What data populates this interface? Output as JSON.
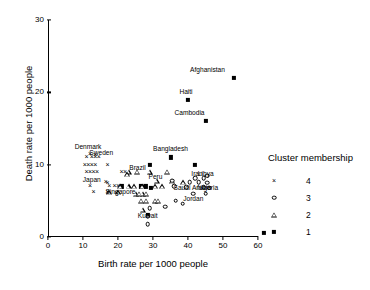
{
  "chart_data": {
    "type": "scatter",
    "title": "",
    "xlabel": "Birth rate per 1000 people",
    "ylabel": "Death rate per 1000 people",
    "xlim": [
      0,
      60
    ],
    "ylim": [
      0,
      30
    ],
    "xticks": [
      0,
      10,
      20,
      30,
      40,
      50,
      60
    ],
    "yticks": [
      0,
      10,
      20,
      30
    ],
    "grid": false,
    "legend": {
      "title": "Cluster membership",
      "position": "right",
      "entries": [
        {
          "label": "4",
          "marker": "x-marker",
          "cluster": 4
        },
        {
          "label": "3",
          "marker": "open-circle-marker",
          "cluster": 3
        },
        {
          "label": "2",
          "marker": "open-triangle-marker",
          "cluster": 2
        },
        {
          "label": "1",
          "marker": "filled-square-marker",
          "cluster": 1
        }
      ]
    },
    "series": [
      {
        "name": "Cluster 1",
        "marker": "filled-square-marker",
        "points": [
          {
            "x": 53,
            "y": 22,
            "label": "Afghanistan"
          },
          {
            "x": 40,
            "y": 19,
            "label": "Haiti"
          },
          {
            "x": 45,
            "y": 16,
            "label": "Cambodia"
          },
          {
            "x": 35,
            "y": 11,
            "label": "Bangladesh"
          },
          {
            "x": 29,
            "y": 10,
            "label": ""
          },
          {
            "x": 42,
            "y": 10,
            "label": ""
          },
          {
            "x": 21,
            "y": 7,
            "label": ""
          },
          {
            "x": 26.5,
            "y": 7,
            "label": ""
          },
          {
            "x": 28,
            "y": 7,
            "label": ""
          },
          {
            "x": 29.5,
            "y": 6.8,
            "label": ""
          },
          {
            "x": 28.5,
            "y": 3,
            "label": "Kuwait"
          }
        ]
      },
      {
        "name": "Cluster 2",
        "marker": "open-triangle-marker",
        "points": [
          {
            "x": 23,
            "y": 9,
            "label": ""
          },
          {
            "x": 25.5,
            "y": 9,
            "label": ""
          },
          {
            "x": 29,
            "y": 9,
            "label": ""
          },
          {
            "x": 34,
            "y": 9,
            "label": ""
          },
          {
            "x": 22.5,
            "y": 8.7,
            "label": ""
          },
          {
            "x": 31,
            "y": 7.8,
            "label": "Peru"
          },
          {
            "x": 35.5,
            "y": 7.7,
            "label": ""
          },
          {
            "x": 38.5,
            "y": 7.6,
            "label": ""
          },
          {
            "x": 20.5,
            "y": 7,
            "label": ""
          },
          {
            "x": 23,
            "y": 7,
            "label": ""
          },
          {
            "x": 24.5,
            "y": 7,
            "label": ""
          },
          {
            "x": 27,
            "y": 7,
            "label": ""
          },
          {
            "x": 30.5,
            "y": 7,
            "label": ""
          },
          {
            "x": 32.5,
            "y": 7,
            "label": ""
          },
          {
            "x": 17.5,
            "y": 6.2,
            "label": ""
          },
          {
            "x": 20,
            "y": 6.2,
            "label": ""
          },
          {
            "x": 25,
            "y": 6,
            "label": ""
          },
          {
            "x": 26,
            "y": 6,
            "label": ""
          },
          {
            "x": 27,
            "y": 6,
            "label": ""
          },
          {
            "x": 28,
            "y": 6,
            "label": ""
          },
          {
            "x": 26.5,
            "y": 5,
            "label": ""
          },
          {
            "x": 28,
            "y": 5,
            "label": ""
          },
          {
            "x": 30.5,
            "y": 5,
            "label": ""
          },
          {
            "x": 31.5,
            "y": 5,
            "label": ""
          },
          {
            "x": 27,
            "y": 3.8,
            "label": ""
          }
        ]
      },
      {
        "name": "Cluster 3",
        "marker": "open-circle-marker",
        "points": [
          {
            "x": 45.5,
            "y": 8.5,
            "label": ""
          },
          {
            "x": 42,
            "y": 8.1,
            "label": "Iran"
          },
          {
            "x": 44.5,
            "y": 8.1,
            "label": "Libya"
          },
          {
            "x": 35.5,
            "y": 7.8,
            "label": ""
          },
          {
            "x": 40.5,
            "y": 7.6,
            "label": ""
          },
          {
            "x": 43,
            "y": 7.6,
            "label": ""
          },
          {
            "x": 45.5,
            "y": 7.5,
            "label": ""
          },
          {
            "x": 36,
            "y": 7,
            "label": ""
          },
          {
            "x": 39.5,
            "y": 6.9,
            "label": "Saudi Arabia"
          },
          {
            "x": 44.5,
            "y": 6.9,
            "label": "Nigeria"
          },
          {
            "x": 46,
            "y": 6.8,
            "label": ""
          },
          {
            "x": 41.5,
            "y": 6,
            "label": "Jordan"
          },
          {
            "x": 45,
            "y": 6,
            "label": ""
          },
          {
            "x": 36.5,
            "y": 5,
            "label": ""
          },
          {
            "x": 38.5,
            "y": 4.6,
            "label": ""
          },
          {
            "x": 33.5,
            "y": 4.2,
            "label": ""
          },
          {
            "x": 29,
            "y": 4,
            "label": ""
          },
          {
            "x": 28.5,
            "y": 2.8,
            "label": ""
          },
          {
            "x": 28.5,
            "y": 1.8,
            "label": ""
          }
        ]
      },
      {
        "name": "Cluster 4",
        "marker": "x-marker",
        "points": [
          {
            "x": 12,
            "y": 11.5,
            "label": "Denmark"
          },
          {
            "x": 13.5,
            "y": 11.3,
            "label": "Sweden"
          },
          {
            "x": 11,
            "y": 11,
            "label": ""
          },
          {
            "x": 12.5,
            "y": 11,
            "label": ""
          },
          {
            "x": 13.5,
            "y": 11,
            "label": ""
          },
          {
            "x": 14.5,
            "y": 11,
            "label": ""
          },
          {
            "x": 10.5,
            "y": 10,
            "label": ""
          },
          {
            "x": 11.5,
            "y": 10,
            "label": ""
          },
          {
            "x": 12.5,
            "y": 10,
            "label": ""
          },
          {
            "x": 13.5,
            "y": 10,
            "label": ""
          },
          {
            "x": 17,
            "y": 10,
            "label": ""
          },
          {
            "x": 11,
            "y": 9,
            "label": ""
          },
          {
            "x": 12,
            "y": 9,
            "label": ""
          },
          {
            "x": 13,
            "y": 9,
            "label": ""
          },
          {
            "x": 14,
            "y": 9,
            "label": ""
          },
          {
            "x": 21,
            "y": 9,
            "label": "Brazil"
          },
          {
            "x": 22,
            "y": 9,
            "label": ""
          },
          {
            "x": 16.5,
            "y": 7.6,
            "label": "Japan"
          },
          {
            "x": 17,
            "y": 7.4,
            "label": ""
          },
          {
            "x": 12,
            "y": 7,
            "label": ""
          },
          {
            "x": 17.5,
            "y": 7,
            "label": ""
          },
          {
            "x": 19,
            "y": 7,
            "label": "Singapore"
          },
          {
            "x": 20,
            "y": 7,
            "label": ""
          },
          {
            "x": 13,
            "y": 6.2,
            "label": ""
          },
          {
            "x": 17,
            "y": 6.2,
            "label": ""
          },
          {
            "x": 19.5,
            "y": 6.1,
            "label": ""
          }
        ]
      }
    ],
    "annotations": [
      {
        "text": "Afghanistan",
        "x": 53,
        "y": 22,
        "dx": -26,
        "dy": -9
      },
      {
        "text": "Haiti",
        "x": 40,
        "y": 19,
        "dx": -2,
        "dy": -9
      },
      {
        "text": "Cambodia",
        "x": 45,
        "y": 16,
        "dx": -16,
        "dy": -9
      },
      {
        "text": "Bangladesh",
        "x": 35,
        "y": 11,
        "dx": 0,
        "dy": -9
      },
      {
        "text": "Denmark",
        "x": 12,
        "y": 11.5,
        "dx": -2,
        "dy": -8
      },
      {
        "text": "Sweden",
        "x": 13.5,
        "y": 11.3,
        "dx": 6,
        "dy": -3
      },
      {
        "text": "Brazil",
        "x": 21,
        "y": 9,
        "dx": 16,
        "dy": -5
      },
      {
        "text": "Japan",
        "x": 16.5,
        "y": 7.6,
        "dx": -14,
        "dy": -3
      },
      {
        "text": "Singapore",
        "x": 19,
        "y": 7,
        "dx": 6,
        "dy": 5
      },
      {
        "text": "Peru",
        "x": 31,
        "y": 7.8,
        "dx": -1,
        "dy": -5
      },
      {
        "text": "Iran",
        "x": 42,
        "y": 8.1,
        "dx": 2,
        "dy": -5
      },
      {
        "text": "Libya",
        "x": 44.5,
        "y": 8.1,
        "dx": 2,
        "dy": -5
      },
      {
        "text": "Saudi Arabia",
        "x": 39.5,
        "y": 6.9,
        "dx": 6,
        "dy": 0
      },
      {
        "text": "Nigeria",
        "x": 44.5,
        "y": 6.9,
        "dx": 4,
        "dy": 0
      },
      {
        "text": "Jordan",
        "x": 41.5,
        "y": 6,
        "dx": 0,
        "dy": 4
      },
      {
        "text": "Kuwait",
        "x": 28.5,
        "y": 3,
        "dx": 0,
        "dy": 0
      }
    ]
  }
}
